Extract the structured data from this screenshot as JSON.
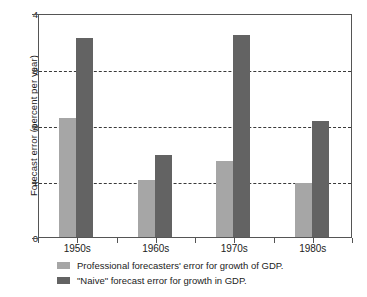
{
  "chart_data": {
    "type": "bar",
    "title": "",
    "xlabel": "",
    "ylabel": "Forecast error (percent per year)",
    "categories": [
      "1950s",
      "1960s",
      "1970s",
      "1980s"
    ],
    "series": [
      {
        "name": "Professional forecasters' error for growth of GDP.",
        "color": "#a6a6a6",
        "values": [
          2.12,
          1.02,
          1.35,
          0.96
        ]
      },
      {
        "name": "\"Naive\" forecast error for growth in GDP.",
        "color": "#636363",
        "values": [
          3.56,
          1.46,
          3.6,
          2.08
        ]
      }
    ],
    "ylim": [
      0,
      4
    ],
    "yticks": [
      0,
      1,
      2,
      3,
      4
    ],
    "ytick_labels": [
      "0",
      "1",
      "2",
      "3",
      "4"
    ],
    "gridlines": [
      1,
      2,
      3
    ],
    "grid": true,
    "grid_style": "dashed",
    "legend_position": "below-left"
  },
  "legend": {
    "items": [
      {
        "label": "Professional forecasters' error for growth of GDP.",
        "swatch": "series0"
      },
      {
        "label": "\"Naive\" forecast error for growth in GDP.",
        "swatch": "series1"
      }
    ]
  }
}
